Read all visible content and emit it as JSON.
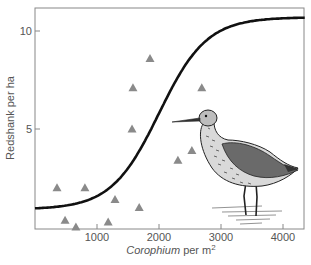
{
  "chart_data": {
    "type": "scatter",
    "title": "",
    "xlabel": "Corophium per m²",
    "xlabel_italic_part": "Corophium",
    "xlabel_rest": " per m",
    "xlabel_superscript": "2",
    "ylabel": "Redshank per ha",
    "xlim": [
      0,
      4350
    ],
    "ylim": [
      0,
      11.6
    ],
    "x_ticks": [
      1000,
      2000,
      3000,
      4000
    ],
    "x_tick_labels": [
      "1000",
      "2000",
      "3000",
      "4000"
    ],
    "y_ticks": [
      5,
      10
    ],
    "y_tick_labels": [
      "5",
      "10"
    ],
    "grid": false,
    "legend": null,
    "series": [
      {
        "name": "observations",
        "marker": "triangle",
        "color": "#8a8a8a",
        "points": [
          {
            "x": 355,
            "y": 2.0
          },
          {
            "x": 485,
            "y": 0.35
          },
          {
            "x": 660,
            "y": 0.0
          },
          {
            "x": 805,
            "y": 2.0
          },
          {
            "x": 1180,
            "y": 0.25
          },
          {
            "x": 1290,
            "y": 1.4
          },
          {
            "x": 1565,
            "y": 5.0
          },
          {
            "x": 1580,
            "y": 7.1
          },
          {
            "x": 1680,
            "y": 1.0
          },
          {
            "x": 1855,
            "y": 8.6
          },
          {
            "x": 2305,
            "y": 3.4
          },
          {
            "x": 2530,
            "y": 3.9
          },
          {
            "x": 2690,
            "y": 7.1
          }
        ]
      },
      {
        "name": "fitted logistic curve",
        "type": "line",
        "color": "#111111",
        "model": {
          "lower": 0.9,
          "upper": 10.7,
          "midpoint": 2000,
          "steepness": 0.0026
        }
      }
    ],
    "annotations": [
      "illustration of a redshank wading bird (lower right)"
    ]
  },
  "colors": {
    "axis": "#777777",
    "marker": "#8a8a8a",
    "curve": "#111111",
    "background": "#ffffff"
  }
}
